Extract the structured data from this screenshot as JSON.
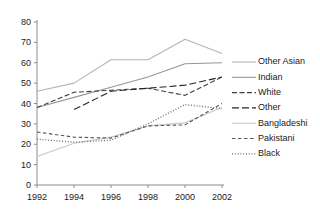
{
  "chart_data": {
    "type": "line",
    "title": "",
    "subtitle": "",
    "xlabel": "",
    "ylabel": "",
    "x": [
      1992,
      1994,
      1996,
      1998,
      2000,
      2002
    ],
    "categories": [
      "1992",
      "1994",
      "1996",
      "1998",
      "2000",
      "2002"
    ],
    "xlim": [
      1992,
      2002
    ],
    "ylim": [
      0,
      80
    ],
    "y_ticks": [
      0,
      10,
      20,
      30,
      40,
      50,
      60,
      70,
      80
    ],
    "y_tick_labels": [
      "0",
      "10",
      "20",
      "30",
      "40",
      "50",
      "60",
      "70",
      "80"
    ],
    "x_ticks": [
      1992,
      1994,
      1996,
      1998,
      2000,
      2002
    ],
    "x_tick_labels": [
      "1992",
      "1994",
      "1996",
      "1998",
      "2000",
      "2002"
    ],
    "grid": false,
    "legend_position": "right",
    "series": [
      {
        "name": "Other Asian",
        "style": "solid",
        "color": "#b4b4b4",
        "x": [
          1992,
          1994,
          1996,
          1998,
          2000,
          2002
        ],
        "values": [
          46,
          50,
          61.5,
          61.5,
          71.5,
          64.5
        ]
      },
      {
        "name": "Indian",
        "style": "solid",
        "color": "#969696",
        "x": [
          1992,
          1994,
          1996,
          1998,
          2000,
          2002
        ],
        "values": [
          38,
          43,
          48,
          53,
          59.5,
          60
        ]
      },
      {
        "name": "White",
        "style": "dashed",
        "color": "#404040",
        "x": [
          1992,
          1994,
          1996,
          1998,
          2000,
          2002
        ],
        "values": [
          38,
          45.5,
          46.5,
          47.5,
          44,
          53
        ]
      },
      {
        "name": "Other",
        "style": "dashed-long",
        "color": "#262626",
        "x": [
          1994,
          1996,
          1998,
          2000,
          2002
        ],
        "values": [
          37,
          46,
          47.5,
          49,
          53
        ]
      },
      {
        "name": "Bangladeshi",
        "style": "solid",
        "color": "#c8c8c8",
        "x": [
          1992,
          1994,
          1996,
          1998,
          2000,
          2002
        ],
        "values": [
          14,
          20.5,
          23.5,
          29,
          30.5,
          38
        ]
      },
      {
        "name": "Pakistani",
        "style": "dashed-short",
        "color": "#555555",
        "x": [
          1992,
          1994,
          1996,
          1998,
          2000,
          2002
        ],
        "values": [
          26,
          23.5,
          23,
          29,
          29.5,
          40
        ]
      },
      {
        "name": "Black",
        "style": "dotted",
        "color": "#6e6e6e",
        "x": [
          1992,
          1994,
          1996,
          1998,
          2000,
          2002
        ],
        "values": [
          22.5,
          21,
          22,
          30,
          39.5,
          37.5
        ]
      }
    ]
  },
  "legend": {
    "entries": [
      {
        "label": "Other Asian"
      },
      {
        "label": "Indian"
      },
      {
        "label": "White"
      },
      {
        "label": "Other"
      },
      {
        "label": "Bangladeshi"
      },
      {
        "label": "Pakistani"
      },
      {
        "label": "Black"
      }
    ]
  }
}
